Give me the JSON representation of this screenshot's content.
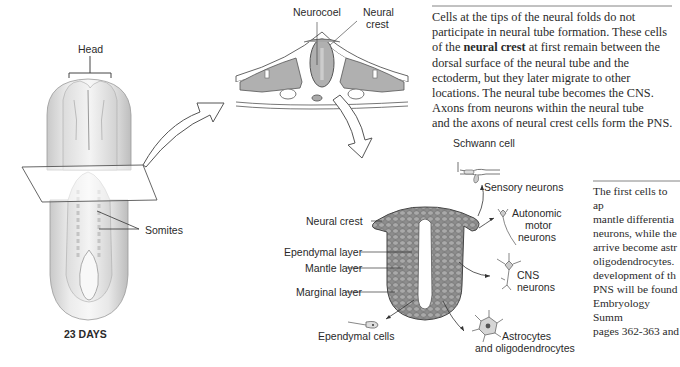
{
  "embryo": {
    "head_label": "Head",
    "somites_label": "Somites",
    "age_label": "23 DAYS"
  },
  "cross_section": {
    "neurocoel_label": "Neurocoel",
    "neural_crest_label_line1": "Neural",
    "neural_crest_label_line2": "crest"
  },
  "neural_tube": {
    "labels": {
      "neural_crest": "Neural crest",
      "ependymal_layer": "Ependymal layer",
      "mantle_layer": "Mantle layer",
      "marginal_layer": "Marginal layer",
      "ependymal_cells": "Ependymal cells",
      "astrocytes_line1": "Astrocytes",
      "astrocytes_line2": "and oligodendrocytes",
      "schwann_cell": "Schwann cell",
      "sensory_neurons": "Sensory neurons",
      "autonomic_line1": "Autonomic",
      "autonomic_line2": "motor",
      "autonomic_line3": "neurons",
      "cns_line1": "CNS",
      "cns_line2": "neurons"
    }
  },
  "caption_top": {
    "lines": [
      "Cells at the tips of the neural folds do not",
      "participate in neural tube formation. These cells",
      "of the ",
      "neural crest",
      " at first remain between the",
      "dorsal surface of the neural tube and the",
      "ectoderm, but they later migrate to other",
      "locations. The neural tube becomes the CNS.",
      "Axons from neurons within the neural tube",
      "and the axons of neural crest cells form the PNS."
    ]
  },
  "caption_right": {
    "lines": [
      "The first cells to ap",
      "mantle differentia",
      "neurons, while the",
      "arrive become astr",
      "oligodendrocytes.",
      "development of th",
      "PNS will be found",
      "Embryology Summ",
      "pages 362-363 and"
    ]
  }
}
